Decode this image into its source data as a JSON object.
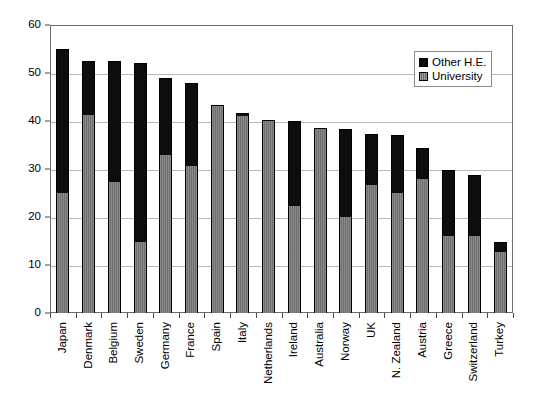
{
  "chart_data": {
    "type": "bar",
    "stacked": true,
    "title": "",
    "subtitle": "",
    "xlabel": "",
    "ylabel": "",
    "ylim": [
      0,
      60
    ],
    "ytick_step": 10,
    "yticks": [
      0,
      10,
      20,
      30,
      40,
      50,
      60
    ],
    "ytick_labels": [
      "0",
      "10",
      "20",
      "30",
      "40",
      "50",
      "60"
    ],
    "grid": true,
    "grid_axis": "y",
    "legend_position": "top-right",
    "categories": [
      "Japan",
      "Denmark",
      "Belgium",
      "Sweden",
      "Germany",
      "France",
      "Spain",
      "Italy",
      "Netherlands",
      "Ireland",
      "Australia",
      "Norway",
      "UK",
      "N. Zealand",
      "Austria",
      "Greece",
      "Switzerland",
      "Turkey"
    ],
    "series": [
      {
        "name": "University",
        "color": "#7c7c7c",
        "values": [
          25.0,
          41.3,
          27.3,
          14.7,
          33.0,
          30.7,
          43.3,
          41.0,
          40.3,
          22.2,
          38.6,
          20.0,
          26.7,
          25.0,
          28.0,
          16.0,
          16.0,
          12.7
        ]
      },
      {
        "name": "Other H.E.",
        "color": "#0d0d0d",
        "values": [
          30.0,
          11.2,
          25.2,
          37.3,
          16.0,
          17.3,
          0.0,
          0.7,
          0.0,
          17.8,
          0.0,
          18.3,
          10.6,
          12.0,
          6.3,
          13.7,
          12.7,
          2.1
        ]
      }
    ],
    "totals": [
      55.0,
      52.5,
      52.5,
      52.0,
      49.0,
      48.0,
      43.3,
      41.7,
      40.3,
      40.0,
      38.6,
      38.3,
      37.3,
      37.0,
      34.3,
      29.7,
      28.7,
      14.8
    ]
  },
  "legend": {
    "entries": [
      {
        "label": "Other H.E.",
        "swatch": "black-square-icon"
      },
      {
        "label": "University",
        "swatch": "gray-square-icon"
      }
    ]
  }
}
